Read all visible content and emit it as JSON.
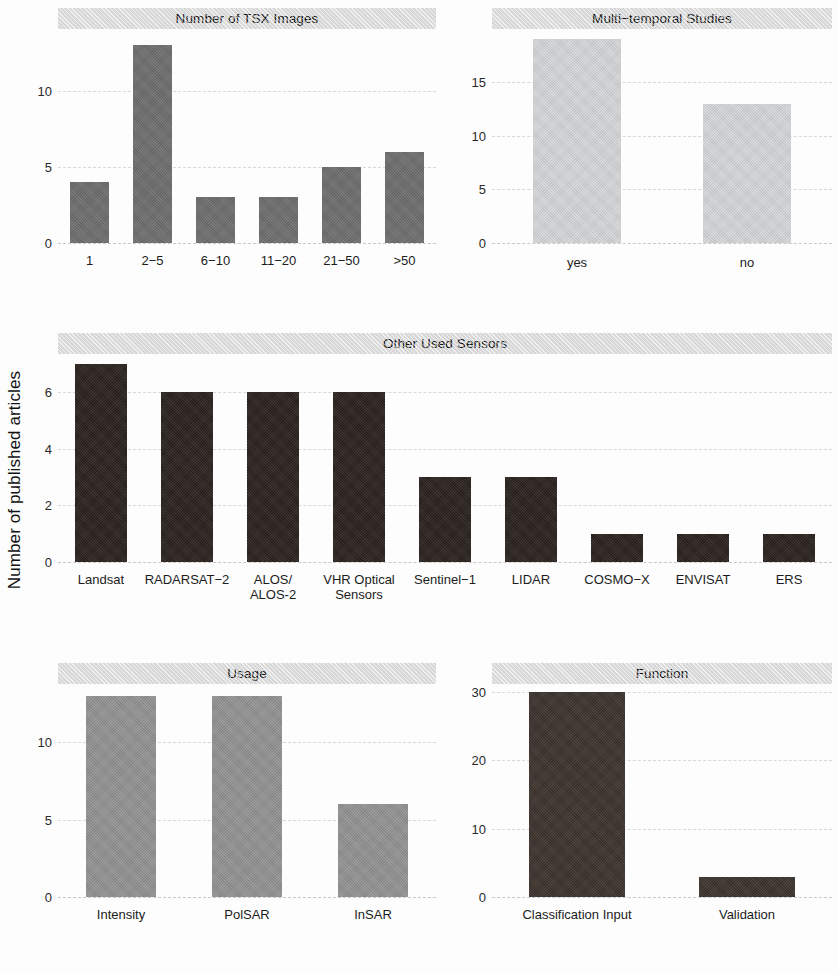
{
  "figure": {
    "shared_ylabel": "Number of published articles",
    "background": "#fdfdfd",
    "strip_color": "#e3e3e3"
  },
  "chart_data": [
    {
      "type": "bar",
      "title": "Number of TSX Images",
      "categories": [
        "1",
        "2−5",
        "6−10",
        "11−20",
        "21−50",
        ">50"
      ],
      "values": [
        4,
        13,
        3,
        3,
        5,
        6
      ],
      "xlabel": "",
      "ylabel": "Number of published articles",
      "ylim": [
        0,
        13.8
      ],
      "yticks": [
        0,
        5,
        10
      ],
      "ytick_labels": [
        "0",
        "5",
        "10"
      ],
      "bar_color": "#6e6e6e",
      "grid": true,
      "legend": "none",
      "panel": "top-left"
    },
    {
      "type": "bar",
      "title": "Multi−temporal Studies",
      "categories": [
        "yes",
        "no"
      ],
      "values": [
        19,
        13
      ],
      "xlabel": "",
      "ylabel": "Number of published articles",
      "ylim": [
        0,
        19.6
      ],
      "yticks": [
        0,
        5,
        10,
        15
      ],
      "ytick_labels": [
        "0",
        "5",
        "10",
        "15"
      ],
      "bar_color": "#d5d7d8",
      "grid": true,
      "legend": "none",
      "panel": "top-right"
    },
    {
      "type": "bar",
      "title": "Other Used Sensors",
      "categories": [
        "Landsat",
        "RADARSAT−2",
        "ALOS/\nALOS-2",
        "VHR Optical\nSensors",
        "Sentinel−1",
        "LIDAR",
        "COSMO−X",
        "ENVISAT",
        "ERS"
      ],
      "values": [
        7,
        6,
        6,
        6,
        3,
        3,
        1,
        1,
        1
      ],
      "xlabel": "",
      "ylabel": "Number of published articles",
      "ylim": [
        0,
        7.2
      ],
      "yticks": [
        0,
        2,
        4,
        6
      ],
      "ytick_labels": [
        "0",
        "2",
        "4",
        "6"
      ],
      "bar_color": "#2a211d",
      "grid": true,
      "legend": "none",
      "panel": "middle-full"
    },
    {
      "type": "bar",
      "title": "Usage",
      "categories": [
        "Intensity",
        "PolSAR",
        "InSAR"
      ],
      "values": [
        13,
        13,
        6
      ],
      "xlabel": "",
      "ylabel": "Number of published articles",
      "ylim": [
        0,
        13.5
      ],
      "yticks": [
        0,
        5,
        10
      ],
      "ytick_labels": [
        "0",
        "5",
        "10"
      ],
      "bar_color": "#939393",
      "grid": true,
      "legend": "none",
      "panel": "bottom-left"
    },
    {
      "type": "bar",
      "title": "Function",
      "categories": [
        "Classification Input",
        "Validation"
      ],
      "values": [
        30,
        3
      ],
      "xlabel": "",
      "ylabel": "Number of published articles",
      "ylim": [
        0,
        30.6
      ],
      "yticks": [
        0,
        10,
        20,
        30
      ],
      "ytick_labels": [
        "0",
        "10",
        "20",
        "30"
      ],
      "bar_color": "#3b322c",
      "grid": true,
      "legend": "none",
      "panel": "bottom-right"
    }
  ]
}
